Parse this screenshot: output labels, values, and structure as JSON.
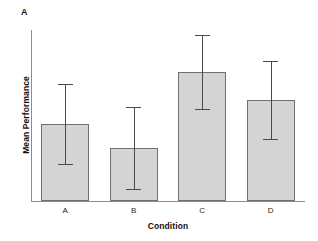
{
  "figure": {
    "panel_label": "A",
    "background_color": "#ffffff"
  },
  "chart_data": {
    "type": "bar",
    "title": "A",
    "xlabel": "Condition",
    "ylabel": "Mean Performance",
    "categories": [
      "A",
      "B",
      "C",
      "D"
    ],
    "values": [
      45.0,
      31.0,
      75.4,
      59.1
    ],
    "errors": [
      23.4,
      23.9,
      21.6,
      22.8
    ],
    "error_lower": [
      21.6,
      7.1,
      53.8,
      36.3
    ],
    "error_upper": [
      68.4,
      54.9,
      97.0,
      81.9
    ],
    "ylim": [
      0,
      100
    ],
    "grid": false,
    "legend": null,
    "axis_tick_labels_y": [],
    "bar_fill_color": "#d4d4d4",
    "bar_edge_color": "#6f6f6f",
    "error_bar_color": "#4a4a4a",
    "axis_color": "#8c8c8c",
    "error_bar_style": "capped"
  },
  "axes": {
    "x_title": "Condition",
    "y_title": "Mean Performance",
    "x_tick_labels": [
      "A",
      "B",
      "C",
      "D"
    ]
  }
}
